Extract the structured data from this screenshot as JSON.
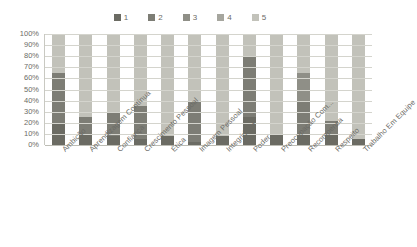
{
  "title": "",
  "legend": {
    "position": "top",
    "items": [
      {
        "label": "1",
        "color": "#6b6b63"
      },
      {
        "label": "2",
        "color": "#7d7d75"
      },
      {
        "label": "3",
        "color": "#8f8f87"
      },
      {
        "label": "4",
        "color": "#a6a69e"
      },
      {
        "label": "5",
        "color": "#c2c2ba"
      }
    ]
  },
  "axis": {
    "y_ticks": [
      "100%",
      "90%",
      "80%",
      "70%",
      "60%",
      "50%",
      "40%",
      "30%",
      "20%",
      "10%",
      "0%"
    ]
  },
  "chart_data": {
    "type": "bar",
    "subtype": "stacked-100-percent",
    "title": "",
    "xlabel": "",
    "ylabel": "",
    "ylim": [
      0,
      100
    ],
    "ytick_format": "percent",
    "ytick_step": 10,
    "grid": true,
    "legend_position": "top",
    "categories": [
      "Ambição",
      "Aprendizagem Contínua",
      "Confiança",
      "Crescimento Pessoal",
      "Ética",
      "Imagem Pessoal",
      "Integridade",
      "Poder",
      "Preocupação Com...",
      "Recompensa",
      "Respeito",
      "Trabalho Em Equipe"
    ],
    "series": [
      {
        "name": "1",
        "color": "#6b6b63",
        "values": [
          20,
          10,
          8,
          5,
          8,
          3,
          8,
          25,
          10,
          10,
          10,
          5
        ]
      },
      {
        "name": "2",
        "color": "#7d7d75",
        "values": [
          45,
          15,
          22,
          30,
          0,
          37,
          0,
          55,
          0,
          30,
          12,
          0
        ]
      },
      {
        "name": "3",
        "color": "#8f8f87",
        "values": [
          0,
          0,
          0,
          0,
          0,
          0,
          0,
          0,
          0,
          25,
          0,
          0
        ]
      },
      {
        "name": "4",
        "color": "#a6a69e",
        "values": [
          0,
          0,
          0,
          0,
          0,
          0,
          0,
          0,
          0,
          0,
          0,
          0
        ]
      },
      {
        "name": "5",
        "color": "#c2c2ba",
        "values": [
          35,
          75,
          70,
          65,
          92,
          60,
          92,
          20,
          90,
          35,
          78,
          95
        ]
      }
    ]
  }
}
